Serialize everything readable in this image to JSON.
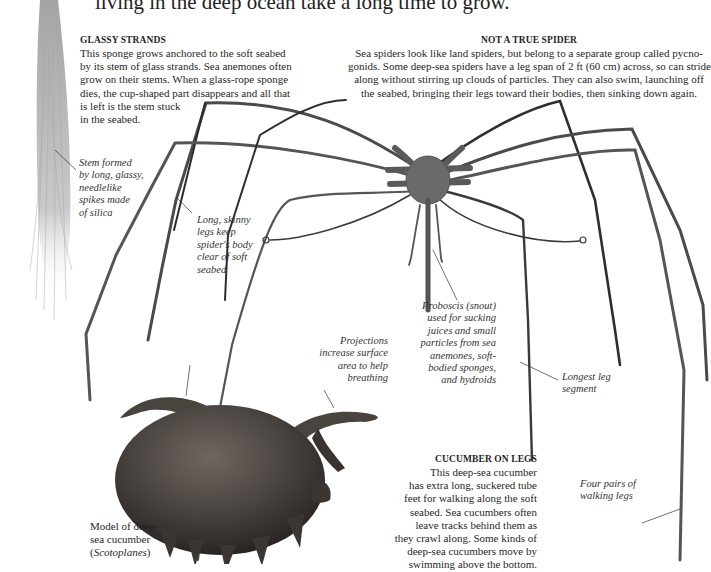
{
  "page": {
    "intro_line": "living in the deep ocean take a long time to grow."
  },
  "glassy_strands": {
    "heading": "GLASSY STRANDS",
    "lines": [
      "This sponge grows anchored to the soft seabed",
      "by its stem of glass strands. Sea anemones often",
      "grow on their stems. When a glass-rope sponge",
      "dies, the cup-shaped part disappears and all that",
      "is left is the stem stuck",
      "in the seabed."
    ]
  },
  "not_a_true_spider": {
    "heading": "NOT A TRUE SPIDER",
    "lines": [
      "Sea spiders look like land spiders, but belong to a separate group called pycno-",
      "gonids. Some deep-sea spiders have a leg span of 2 ft (60 cm) across, so can stride",
      "along without stirring up clouds of particles. They can also swim, launching off",
      "the seabed, bringing their legs toward their bodies, then sinking down again."
    ]
  },
  "cucumber_on_legs": {
    "heading": "CUCUMBER ON LEGS",
    "lines": [
      "This deep-sea cucumber",
      "has extra long, suckered tube",
      "feet for walking along the soft",
      "seabed. Sea cucumbers often",
      "leave tracks behind them as",
      "they crawl along. Some kinds of",
      "deep-sea cucumbers move by",
      "swimming above the bottom."
    ]
  },
  "captions": {
    "stem": [
      "Stem formed",
      "by long, glassy,",
      "needlelike",
      "spikes made",
      "of silica"
    ],
    "legs": [
      "Long, skinny",
      "legs keep",
      "spider's body",
      "clear of soft",
      "seabed"
    ],
    "proboscis": [
      "Proboscis (snout)",
      "used for sucking",
      "juices and small",
      "particles from sea",
      "anemones, soft-",
      "bodied sponges,",
      "and hydroids"
    ],
    "projections": [
      "Projections",
      "increase surface",
      "area to help",
      "breathing"
    ],
    "longest_leg": [
      "Longest leg",
      "segment"
    ],
    "four_pairs": [
      "Four pairs of",
      "walking legs"
    ],
    "model": {
      "line1": "Model of deep-",
      "line2": "sea cucumber",
      "open_paren": "(",
      "species": "Scotoplanes",
      "close_paren": ")"
    }
  },
  "images": {
    "sponge_stem": "glass-rope-sponge-stem",
    "sea_spider": "deep-sea-spider-pycnogonid",
    "sea_cucumber": "scotoplanes-model"
  },
  "colors": {
    "text": "#1f1f1f",
    "spider_leg": "#4a4a4a",
    "cucumber_body": "#4b4541",
    "sponge_strands": "#b5b5b5"
  }
}
